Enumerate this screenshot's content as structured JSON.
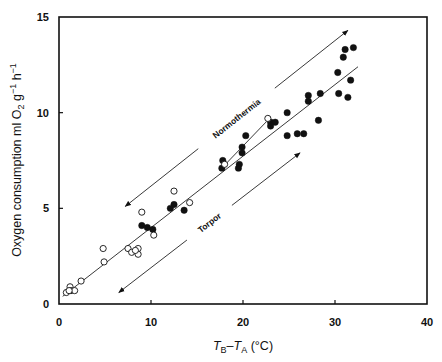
{
  "chart_data": {
    "type": "scatter",
    "title": "",
    "xlabel": "T_B–T_A (°C)",
    "xlabel_parts": {
      "t1": "T",
      "sub1": "B",
      "dash": "–",
      "t2": "T",
      "sub2": "A",
      "unit": " (°C)"
    },
    "ylabel": "Oxygen consumption ml O2 g-1 h-1",
    "ylabel_parts": {
      "main": "Oxygen consumption ml O",
      "sub": "2",
      "mid": " g",
      "sup1": "−1",
      "h": " h",
      "sup2": "−1"
    },
    "xlim": [
      0,
      40
    ],
    "ylim": [
      0,
      15
    ],
    "xticks": [
      0,
      10,
      20,
      30,
      40
    ],
    "yticks": [
      0,
      5,
      10,
      15
    ],
    "grid": false,
    "legend": null,
    "series": [
      {
        "name": "Normothermia (filled circles)",
        "marker": "filled-circle",
        "points": [
          [
            32.0,
            13.4
          ],
          [
            31.1,
            13.3
          ],
          [
            30.9,
            12.9
          ],
          [
            30.3,
            12.1
          ],
          [
            31.7,
            11.7
          ],
          [
            30.4,
            11.0
          ],
          [
            31.4,
            10.8
          ],
          [
            28.4,
            11.0
          ],
          [
            27.1,
            10.9
          ],
          [
            27.1,
            10.6
          ],
          [
            24.8,
            10.0
          ],
          [
            28.2,
            9.6
          ],
          [
            24.8,
            8.8
          ],
          [
            25.9,
            8.9
          ],
          [
            26.6,
            8.9
          ],
          [
            23.0,
            9.5
          ],
          [
            23.5,
            9.5
          ],
          [
            23.0,
            9.3
          ],
          [
            20.3,
            8.8
          ],
          [
            19.9,
            8.2
          ],
          [
            19.9,
            7.9
          ],
          [
            17.8,
            7.5
          ],
          [
            19.6,
            7.3
          ],
          [
            19.5,
            7.1
          ],
          [
            17.7,
            7.1
          ],
          [
            12.5,
            5.2
          ],
          [
            12.1,
            5.0
          ],
          [
            13.6,
            4.9
          ],
          [
            9.0,
            4.1
          ],
          [
            9.6,
            4.0
          ],
          [
            10.2,
            3.9
          ]
        ]
      },
      {
        "name": "Torpor (open circles)",
        "marker": "open-circle",
        "points": [
          [
            22.7,
            9.7
          ],
          [
            18.0,
            7.3
          ],
          [
            12.5,
            5.9
          ],
          [
            14.2,
            5.3
          ],
          [
            9.0,
            4.8
          ],
          [
            10.3,
            3.6
          ],
          [
            4.8,
            2.9
          ],
          [
            4.9,
            2.2
          ],
          [
            7.5,
            2.9
          ],
          [
            7.9,
            2.7
          ],
          [
            8.6,
            2.9
          ],
          [
            8.6,
            2.6
          ],
          [
            8.3,
            2.8
          ],
          [
            2.4,
            1.2
          ],
          [
            1.2,
            0.9
          ],
          [
            1.3,
            0.7
          ],
          [
            0.8,
            0.6
          ],
          [
            1.7,
            0.7
          ],
          [
            1.1,
            0.7
          ]
        ]
      }
    ],
    "fit_lines": [
      {
        "name": "overall regression",
        "from": [
          0.4,
          0.4
        ],
        "to": [
          32.5,
          12.4
        ]
      },
      {
        "name": "secondary regression",
        "from": [
          17.8,
          7.0
        ],
        "to": [
          23.0,
          9.6
        ]
      }
    ],
    "annotations": [
      {
        "text": "Normothermia",
        "arrow": "double-headed",
        "from": [
          7.2,
          5.1
        ],
        "to": [
          31.4,
          14.3
        ]
      },
      {
        "text": "Torpor",
        "arrow": "double-headed",
        "from": [
          6.5,
          0.6
        ],
        "to": [
          26.2,
          7.9
        ]
      }
    ]
  }
}
